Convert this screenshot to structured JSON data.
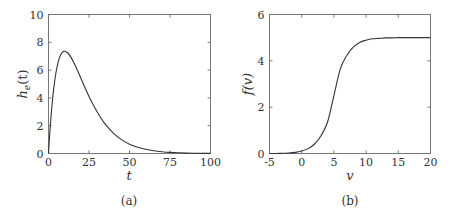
{
  "chart_data": [
    {
      "id": "a",
      "type": "line",
      "caption": "(a)",
      "title": "",
      "xlabel": "t",
      "ylabel": "h_e(t)",
      "ylabel_base": "h",
      "ylabel_sub": "e",
      "ylabel_arg": "(t)",
      "xlim": [
        0,
        100
      ],
      "ylim": [
        0,
        10
      ],
      "xticks": [
        0,
        25,
        50,
        75,
        100
      ],
      "yticks": [
        0,
        2,
        4,
        6,
        8,
        10
      ],
      "grid": false,
      "series": [
        {
          "name": "h_e(t)",
          "x": [
            0,
            1,
            2,
            3,
            4,
            5,
            6,
            7,
            8,
            9,
            10,
            12,
            14,
            16,
            18,
            20,
            22,
            25,
            28,
            31,
            35,
            40,
            45,
            50,
            55,
            60,
            65,
            70,
            75,
            80,
            85,
            90,
            95,
            100
          ],
          "y": [
            0,
            1.81,
            3.27,
            4.45,
            5.36,
            6.07,
            6.59,
            6.95,
            7.19,
            7.32,
            7.36,
            7.23,
            6.9,
            6.46,
            5.95,
            5.41,
            4.87,
            4.1,
            3.42,
            2.81,
            2.11,
            1.47,
            1.0,
            0.67,
            0.45,
            0.3,
            0.2,
            0.13,
            0.08,
            0.05,
            0.03,
            0.02,
            0.01,
            0.01
          ]
        }
      ]
    },
    {
      "id": "b",
      "type": "line",
      "caption": "(b)",
      "title": "",
      "xlabel": "v",
      "ylabel": "f(v)",
      "xlim": [
        -5,
        20
      ],
      "ylim": [
        0,
        6
      ],
      "xticks": [
        -5,
        0,
        5,
        10,
        15,
        20
      ],
      "yticks": [
        0,
        2,
        4,
        6
      ],
      "grid": false,
      "series": [
        {
          "name": "f(v)",
          "x": [
            -5,
            -4,
            -3,
            -2,
            -1,
            0,
            1,
            2,
            3,
            4,
            5,
            6,
            7,
            8,
            9,
            10,
            11,
            12,
            13,
            14,
            15,
            16,
            17,
            18,
            19,
            20
          ],
          "y": [
            0.0,
            0.0,
            0.01,
            0.02,
            0.05,
            0.11,
            0.21,
            0.41,
            0.77,
            1.35,
            2.5,
            3.65,
            4.23,
            4.59,
            4.79,
            4.89,
            4.95,
            4.97,
            4.99,
            4.99,
            5.0,
            5.0,
            5.0,
            5.0,
            5.0,
            5.0
          ]
        }
      ]
    }
  ]
}
